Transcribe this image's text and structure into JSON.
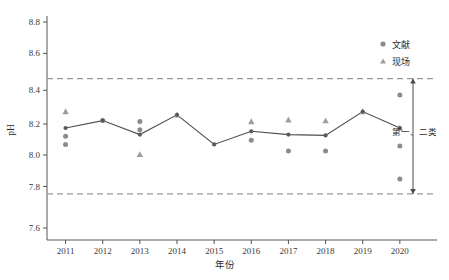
{
  "chart_data": {
    "type": "line",
    "title": "",
    "xlabel": "年份",
    "ylabel": "pH",
    "x": [
      2011,
      2012,
      2013,
      2014,
      2015,
      2016,
      2017,
      2018,
      2019,
      2020
    ],
    "xtick_labels": [
      "2011",
      "2012",
      "2013",
      "2014",
      "2015",
      "2016",
      "2017",
      "2018",
      "2019",
      "2020"
    ],
    "ytick_labels": [
      "8.8",
      "8.6",
      "8.4",
      "8.2",
      "8.0",
      "7.8",
      "7.6"
    ],
    "yticks": [
      8.8,
      8.6,
      8.4,
      8.2,
      8.0,
      7.8,
      7.6
    ],
    "ylim": [
      7.52,
      8.88
    ],
    "xlim": [
      2010.5,
      2021.0
    ],
    "grid": false,
    "legend_position": "top-right",
    "series": [
      {
        "name": "趋势线",
        "type": "line",
        "marker": "circle",
        "color": "#4d4d4d",
        "values": [
          8.2,
          8.245,
          8.16,
          8.28,
          8.1,
          8.18,
          8.16,
          8.155,
          8.3,
          8.2
        ]
      },
      {
        "name": "文献",
        "type": "scatter",
        "marker": "circle",
        "color": "#8c8c8c",
        "points": [
          {
            "x": 2011,
            "y": 8.15
          },
          {
            "x": 2011,
            "y": 8.1
          },
          {
            "x": 2012,
            "y": 8.245
          },
          {
            "x": 2013,
            "y": 8.24
          },
          {
            "x": 2013,
            "y": 8.19
          },
          {
            "x": 2016,
            "y": 8.125
          },
          {
            "x": 2017,
            "y": 8.06
          },
          {
            "x": 2018,
            "y": 8.06
          },
          {
            "x": 2020,
            "y": 8.4
          },
          {
            "x": 2020,
            "y": 8.09
          },
          {
            "x": 2020,
            "y": 7.89
          }
        ]
      },
      {
        "name": "现场",
        "type": "scatter",
        "marker": "triangle",
        "color": "#9e9e9e",
        "points": [
          {
            "x": 2011,
            "y": 8.3
          },
          {
            "x": 2013,
            "y": 8.04
          },
          {
            "x": 2014,
            "y": 8.28
          },
          {
            "x": 2016,
            "y": 8.24
          },
          {
            "x": 2017,
            "y": 8.25
          },
          {
            "x": 2018,
            "y": 8.245
          },
          {
            "x": 2019,
            "y": 8.3
          },
          {
            "x": 2020,
            "y": 8.2
          }
        ]
      }
    ],
    "reference_lines": [
      {
        "name": "upper-standard-line",
        "value": 8.5,
        "style": "dashed",
        "color": "#9a9a9a"
      },
      {
        "name": "lower-standard-line",
        "value": 7.8,
        "style": "dashed",
        "color": "#9a9a9a"
      }
    ],
    "annotations": [
      {
        "name": "class-range-annotation",
        "label": "第一、二类",
        "from": 7.8,
        "to": 8.5,
        "arrow": "double"
      }
    ]
  },
  "legend": {
    "items": [
      {
        "label": "文献",
        "marker": "circle",
        "color": "#8c8c8c"
      },
      {
        "label": "现场",
        "marker": "triangle",
        "color": "#9e9e9e"
      }
    ]
  },
  "axes": {
    "y_title": "pH",
    "x_title": "年份"
  }
}
